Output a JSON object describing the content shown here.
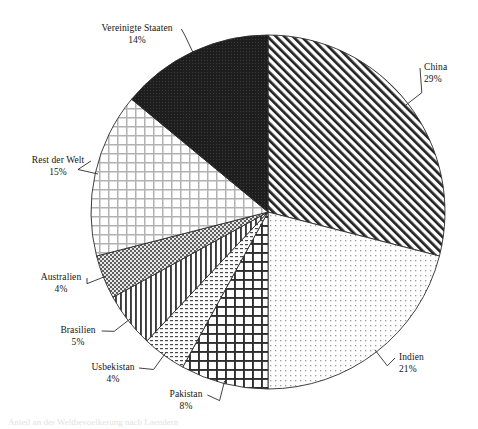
{
  "chart_data": {
    "type": "pie",
    "title": "",
    "subtitle": "",
    "xlabel": "",
    "ylabel": "",
    "legend_position": "none",
    "grid": false,
    "labels_show_percent": true,
    "start_angle_deg": 0,
    "direction": "clockwise",
    "categories": [
      "China",
      "Indien",
      "Pakistan",
      "Usbekistan",
      "Brasilien",
      "Australien",
      "Rest der Welt",
      "Vereinigte Staaten"
    ],
    "values": [
      29,
      21,
      8,
      4,
      5,
      4,
      15,
      14
    ],
    "unit": "%",
    "slices": [
      {
        "name": "China",
        "percent": 29,
        "percent_label": "29%",
        "pattern": "diagonal-hatch-dark",
        "label_align": "left",
        "label_x": 424,
        "label_y": 62
      },
      {
        "name": "Indien",
        "percent": 21,
        "percent_label": "21%",
        "pattern": "fine-dots-light",
        "label_align": "left",
        "label_x": 399,
        "label_y": 352
      },
      {
        "name": "Pakistan",
        "percent": 8,
        "percent_label": "8%",
        "pattern": "crosshatch-dark",
        "label_align": "center",
        "label_x": 186,
        "label_y": 389
      },
      {
        "name": "Usbekistan",
        "percent": 4,
        "percent_label": "4%",
        "pattern": "fine-dash-dots",
        "label_align": "center",
        "label_x": 113,
        "label_y": 362
      },
      {
        "name": "Brasilien",
        "percent": 5,
        "percent_label": "5%",
        "pattern": "vertical-lines",
        "label_align": "center",
        "label_x": 78,
        "label_y": 325
      },
      {
        "name": "Australien",
        "percent": 4,
        "percent_label": "4%",
        "pattern": "dense-stipple-gray",
        "label_align": "center",
        "label_x": 61,
        "label_y": 272
      },
      {
        "name": "Rest der Welt",
        "percent": 15,
        "percent_label": "15%",
        "pattern": "crosshatch-light",
        "label_align": "center",
        "label_x": 58,
        "label_y": 155
      },
      {
        "name": "Vereinigte Staaten",
        "percent": 14,
        "percent_label": "14%",
        "pattern": "solid-black",
        "label_align": "center",
        "label_x": 137,
        "label_y": 23
      }
    ],
    "geometry": {
      "center_x": 268,
      "center_y": 212,
      "radius": 177
    },
    "colors": {
      "outline": "#2b2b2b",
      "background": "#ffffff",
      "text": "#141414",
      "solid_slice": "#1e1e1e"
    }
  },
  "footer": {
    "partial_text": "Anteil an der Weltbevoelkerung nach Laendern"
  }
}
